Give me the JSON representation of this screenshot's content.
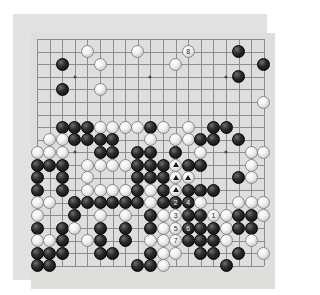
{
  "app": {
    "title": "Go Board Diagram",
    "kind": "go-game-position"
  },
  "board": {
    "size": 19,
    "colors": {
      "surface": "#dededd",
      "frame": "#e2e2e2",
      "grid_line": "#8d8d8d",
      "star_point": "#4a4a4a",
      "black_stone": "#0b0b0b",
      "white_stone": "#f2f2f2",
      "page_background": "#ffffff"
    },
    "origin_px": {
      "x": 24,
      "y": 25
    },
    "cell_px": 12.6,
    "star_points": [
      [
        3,
        3
      ],
      [
        9,
        3
      ],
      [
        15,
        3
      ],
      [
        3,
        9
      ],
      [
        9,
        9
      ],
      [
        15,
        9
      ],
      [
        3,
        15
      ],
      [
        9,
        15
      ],
      [
        15,
        15
      ]
    ],
    "legend": {
      "black_label": "Black",
      "white_label": "White",
      "triangle_label": "triangle-mark"
    }
  },
  "stones": [
    {
      "x": 8,
      "y": 1,
      "color": "white"
    },
    {
      "x": 12,
      "y": 1,
      "color": "white",
      "label": "8"
    },
    {
      "x": 16,
      "y": 1,
      "color": "black"
    },
    {
      "x": 4,
      "y": 1,
      "color": "white"
    },
    {
      "x": 2,
      "y": 2,
      "color": "black"
    },
    {
      "x": 5,
      "y": 2,
      "color": "white"
    },
    {
      "x": 11,
      "y": 2,
      "color": "white"
    },
    {
      "x": 16,
      "y": 3,
      "color": "black"
    },
    {
      "x": 18,
      "y": 2,
      "color": "black"
    },
    {
      "x": 2,
      "y": 4,
      "color": "black"
    },
    {
      "x": 5,
      "y": 4,
      "color": "white"
    },
    {
      "x": 18,
      "y": 5,
      "color": "white"
    },
    {
      "x": 2,
      "y": 7,
      "color": "black"
    },
    {
      "x": 3,
      "y": 7,
      "color": "black"
    },
    {
      "x": 4,
      "y": 7,
      "color": "black"
    },
    {
      "x": 5,
      "y": 7,
      "color": "white"
    },
    {
      "x": 6,
      "y": 7,
      "color": "white"
    },
    {
      "x": 7,
      "y": 7,
      "color": "white"
    },
    {
      "x": 8,
      "y": 7,
      "color": "white"
    },
    {
      "x": 9,
      "y": 7,
      "color": "black"
    },
    {
      "x": 10,
      "y": 7,
      "color": "white"
    },
    {
      "x": 12,
      "y": 7,
      "color": "white"
    },
    {
      "x": 14,
      "y": 7,
      "color": "black"
    },
    {
      "x": 15,
      "y": 7,
      "color": "black"
    },
    {
      "x": 1,
      "y": 8,
      "color": "white"
    },
    {
      "x": 2,
      "y": 8,
      "color": "white"
    },
    {
      "x": 3,
      "y": 8,
      "color": "black"
    },
    {
      "x": 4,
      "y": 8,
      "color": "black"
    },
    {
      "x": 5,
      "y": 8,
      "color": "black"
    },
    {
      "x": 6,
      "y": 8,
      "color": "black"
    },
    {
      "x": 9,
      "y": 8,
      "color": "white"
    },
    {
      "x": 11,
      "y": 8,
      "color": "white"
    },
    {
      "x": 12,
      "y": 8,
      "color": "white"
    },
    {
      "x": 13,
      "y": 8,
      "color": "black"
    },
    {
      "x": 14,
      "y": 8,
      "color": "black"
    },
    {
      "x": 16,
      "y": 8,
      "color": "black"
    },
    {
      "x": 0,
      "y": 9,
      "color": "white"
    },
    {
      "x": 1,
      "y": 9,
      "color": "white"
    },
    {
      "x": 2,
      "y": 9,
      "color": "white"
    },
    {
      "x": 5,
      "y": 9,
      "color": "black"
    },
    {
      "x": 6,
      "y": 9,
      "color": "black"
    },
    {
      "x": 8,
      "y": 9,
      "color": "black"
    },
    {
      "x": 9,
      "y": 9,
      "color": "black"
    },
    {
      "x": 11,
      "y": 9,
      "color": "black"
    },
    {
      "x": 13,
      "y": 9,
      "color": "white"
    },
    {
      "x": 17,
      "y": 9,
      "color": "white"
    },
    {
      "x": 18,
      "y": 9,
      "color": "white"
    },
    {
      "x": 0,
      "y": 10,
      "color": "black"
    },
    {
      "x": 1,
      "y": 10,
      "color": "black"
    },
    {
      "x": 2,
      "y": 10,
      "color": "black"
    },
    {
      "x": 4,
      "y": 10,
      "color": "white"
    },
    {
      "x": 5,
      "y": 10,
      "color": "white"
    },
    {
      "x": 6,
      "y": 10,
      "color": "white"
    },
    {
      "x": 7,
      "y": 10,
      "color": "white"
    },
    {
      "x": 8,
      "y": 10,
      "color": "black"
    },
    {
      "x": 9,
      "y": 10,
      "color": "black"
    },
    {
      "x": 10,
      "y": 10,
      "color": "black"
    },
    {
      "x": 11,
      "y": 10,
      "color": "white",
      "mark": "triangle"
    },
    {
      "x": 12,
      "y": 10,
      "color": "black"
    },
    {
      "x": 13,
      "y": 10,
      "color": "black"
    },
    {
      "x": 17,
      "y": 10,
      "color": "white"
    },
    {
      "x": 0,
      "y": 11,
      "color": "black"
    },
    {
      "x": 2,
      "y": 11,
      "color": "black"
    },
    {
      "x": 4,
      "y": 11,
      "color": "white"
    },
    {
      "x": 8,
      "y": 11,
      "color": "black"
    },
    {
      "x": 9,
      "y": 11,
      "color": "black"
    },
    {
      "x": 10,
      "y": 11,
      "color": "black"
    },
    {
      "x": 11,
      "y": 11,
      "color": "white",
      "mark": "triangle"
    },
    {
      "x": 12,
      "y": 11,
      "color": "white",
      "mark": "triangle"
    },
    {
      "x": 16,
      "y": 11,
      "color": "black"
    },
    {
      "x": 17,
      "y": 11,
      "color": "white"
    },
    {
      "x": 0,
      "y": 12,
      "color": "black"
    },
    {
      "x": 2,
      "y": 12,
      "color": "black"
    },
    {
      "x": 4,
      "y": 12,
      "color": "white"
    },
    {
      "x": 5,
      "y": 12,
      "color": "white"
    },
    {
      "x": 6,
      "y": 12,
      "color": "white"
    },
    {
      "x": 7,
      "y": 12,
      "color": "white"
    },
    {
      "x": 8,
      "y": 12,
      "color": "black"
    },
    {
      "x": 9,
      "y": 12,
      "color": "white"
    },
    {
      "x": 10,
      "y": 12,
      "color": "black"
    },
    {
      "x": 11,
      "y": 12,
      "color": "white",
      "mark": "triangle"
    },
    {
      "x": 12,
      "y": 12,
      "color": "black"
    },
    {
      "x": 13,
      "y": 12,
      "color": "black"
    },
    {
      "x": 14,
      "y": 12,
      "color": "black"
    },
    {
      "x": 0,
      "y": 13,
      "color": "white"
    },
    {
      "x": 1,
      "y": 13,
      "color": "white"
    },
    {
      "x": 3,
      "y": 13,
      "color": "black"
    },
    {
      "x": 4,
      "y": 13,
      "color": "black"
    },
    {
      "x": 5,
      "y": 13,
      "color": "black"
    },
    {
      "x": 6,
      "y": 13,
      "color": "black"
    },
    {
      "x": 7,
      "y": 13,
      "color": "black"
    },
    {
      "x": 8,
      "y": 13,
      "color": "black"
    },
    {
      "x": 9,
      "y": 13,
      "color": "white"
    },
    {
      "x": 10,
      "y": 13,
      "color": "black"
    },
    {
      "x": 11,
      "y": 13,
      "color": "black",
      "label": "2"
    },
    {
      "x": 12,
      "y": 13,
      "color": "black",
      "label": "4"
    },
    {
      "x": 13,
      "y": 13,
      "color": "white"
    },
    {
      "x": 16,
      "y": 13,
      "color": "white"
    },
    {
      "x": 17,
      "y": 13,
      "color": "white"
    },
    {
      "x": 18,
      "y": 13,
      "color": "white"
    },
    {
      "x": 0,
      "y": 14,
      "color": "white"
    },
    {
      "x": 3,
      "y": 14,
      "color": "black"
    },
    {
      "x": 5,
      "y": 14,
      "color": "white"
    },
    {
      "x": 7,
      "y": 14,
      "color": "white"
    },
    {
      "x": 9,
      "y": 14,
      "color": "black"
    },
    {
      "x": 10,
      "y": 14,
      "color": "white"
    },
    {
      "x": 11,
      "y": 14,
      "color": "white",
      "label": "3"
    },
    {
      "x": 12,
      "y": 14,
      "color": "black"
    },
    {
      "x": 13,
      "y": 14,
      "color": "black"
    },
    {
      "x": 14,
      "y": 14,
      "color": "white",
      "label": "1"
    },
    {
      "x": 15,
      "y": 14,
      "color": "white"
    },
    {
      "x": 16,
      "y": 14,
      "color": "black"
    },
    {
      "x": 17,
      "y": 14,
      "color": "black"
    },
    {
      "x": 18,
      "y": 14,
      "color": "white"
    },
    {
      "x": 0,
      "y": 15,
      "color": "black"
    },
    {
      "x": 2,
      "y": 15,
      "color": "black"
    },
    {
      "x": 3,
      "y": 15,
      "color": "white"
    },
    {
      "x": 5,
      "y": 15,
      "color": "black"
    },
    {
      "x": 7,
      "y": 15,
      "color": "black"
    },
    {
      "x": 9,
      "y": 15,
      "color": "black"
    },
    {
      "x": 10,
      "y": 15,
      "color": "white"
    },
    {
      "x": 11,
      "y": 15,
      "color": "white",
      "label": "5"
    },
    {
      "x": 12,
      "y": 15,
      "color": "black",
      "label": "6"
    },
    {
      "x": 13,
      "y": 15,
      "color": "black"
    },
    {
      "x": 14,
      "y": 15,
      "color": "black"
    },
    {
      "x": 15,
      "y": 15,
      "color": "white"
    },
    {
      "x": 16,
      "y": 15,
      "color": "black"
    },
    {
      "x": 17,
      "y": 15,
      "color": "black"
    },
    {
      "x": 0,
      "y": 16,
      "color": "white"
    },
    {
      "x": 1,
      "y": 16,
      "color": "white"
    },
    {
      "x": 2,
      "y": 16,
      "color": "black"
    },
    {
      "x": 4,
      "y": 16,
      "color": "white"
    },
    {
      "x": 5,
      "y": 16,
      "color": "black"
    },
    {
      "x": 7,
      "y": 16,
      "color": "black"
    },
    {
      "x": 9,
      "y": 16,
      "color": "white"
    },
    {
      "x": 10,
      "y": 16,
      "color": "white"
    },
    {
      "x": 11,
      "y": 16,
      "color": "white",
      "label": "7"
    },
    {
      "x": 12,
      "y": 16,
      "color": "black"
    },
    {
      "x": 13,
      "y": 16,
      "color": "black"
    },
    {
      "x": 14,
      "y": 16,
      "color": "black"
    },
    {
      "x": 15,
      "y": 16,
      "color": "white"
    },
    {
      "x": 17,
      "y": 16,
      "color": "white"
    },
    {
      "x": 0,
      "y": 17,
      "color": "black"
    },
    {
      "x": 1,
      "y": 17,
      "color": "black"
    },
    {
      "x": 2,
      "y": 17,
      "color": "black"
    },
    {
      "x": 5,
      "y": 17,
      "color": "black"
    },
    {
      "x": 6,
      "y": 17,
      "color": "black"
    },
    {
      "x": 9,
      "y": 17,
      "color": "black"
    },
    {
      "x": 10,
      "y": 17,
      "color": "white"
    },
    {
      "x": 11,
      "y": 17,
      "color": "white"
    },
    {
      "x": 13,
      "y": 17,
      "color": "black"
    },
    {
      "x": 14,
      "y": 17,
      "color": "black"
    },
    {
      "x": 16,
      "y": 17,
      "color": "black"
    },
    {
      "x": 18,
      "y": 17,
      "color": "white"
    },
    {
      "x": 0,
      "y": 18,
      "color": "black"
    },
    {
      "x": 1,
      "y": 18,
      "color": "black"
    },
    {
      "x": 8,
      "y": 18,
      "color": "black"
    },
    {
      "x": 9,
      "y": 18,
      "color": "black"
    },
    {
      "x": 10,
      "y": 18,
      "color": "white"
    },
    {
      "x": 15,
      "y": 18,
      "color": "black"
    }
  ]
}
